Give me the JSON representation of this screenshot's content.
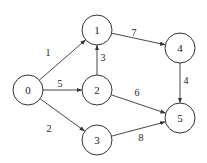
{
  "diagram": {
    "type": "directed-weighted-graph",
    "nodes": [
      {
        "id": "0",
        "label": "0",
        "x": 28,
        "y": 90
      },
      {
        "id": "1",
        "label": "1",
        "x": 97,
        "y": 30
      },
      {
        "id": "2",
        "label": "2",
        "x": 97,
        "y": 90
      },
      {
        "id": "3",
        "label": "3",
        "x": 97,
        "y": 140
      },
      {
        "id": "4",
        "label": "4",
        "x": 180,
        "y": 48
      },
      {
        "id": "5",
        "label": "5",
        "x": 180,
        "y": 118
      }
    ],
    "edges": [
      {
        "from": "0",
        "to": "1",
        "weight": "1",
        "lx": 48,
        "ly": 52
      },
      {
        "from": "0",
        "to": "2",
        "weight": "5",
        "lx": 60,
        "ly": 83
      },
      {
        "from": "0",
        "to": "3",
        "weight": "2",
        "lx": 49,
        "ly": 128
      },
      {
        "from": "2",
        "to": "1",
        "weight": "3",
        "lx": 103,
        "ly": 57
      },
      {
        "from": "1",
        "to": "4",
        "weight": "7",
        "lx": 134,
        "ly": 32
      },
      {
        "from": "2",
        "to": "5",
        "weight": "6",
        "lx": 137,
        "ly": 92
      },
      {
        "from": "3",
        "to": "5",
        "weight": "8",
        "lx": 141,
        "ly": 137
      },
      {
        "from": "4",
        "to": "5",
        "weight": "4",
        "lx": 186,
        "ly": 80
      }
    ]
  }
}
